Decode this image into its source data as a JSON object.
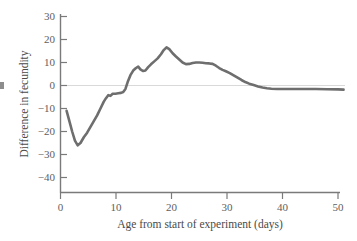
{
  "chart_data": {
    "type": "line",
    "title": "",
    "xlabel": "Age from start of experiment (days)",
    "ylabel": "Difference in fecundity",
    "xlim": [
      0,
      51
    ],
    "ylim": [
      -47,
      33
    ],
    "xticks": [
      0,
      10,
      20,
      30,
      40,
      50
    ],
    "xtick_labels": [
      "0",
      "10",
      "20",
      "30",
      "40",
      "50"
    ],
    "yticks": [
      30,
      20,
      10,
      0,
      -10,
      -20,
      -30,
      -40
    ],
    "ytick_labels": [
      "30",
      "20",
      "10",
      "0",
      "−10",
      "−20",
      "−30",
      "−40"
    ],
    "grid": false,
    "legend": null,
    "zero_reference_line": 0,
    "series": [
      {
        "name": "Difference in fecundity",
        "color": "#6e6e6e",
        "x": [
          1.1,
          1.6,
          2.1,
          2.6,
          3.1,
          3.6,
          4.2,
          4.8,
          5.4,
          6.0,
          6.6,
          7.2,
          7.8,
          8.2,
          8.6,
          9.0,
          9.4,
          9.9,
          10.4,
          10.9,
          11.3,
          11.7,
          12.1,
          12.6,
          13.1,
          13.6,
          14.0,
          14.4,
          14.9,
          15.3,
          15.8,
          16.3,
          16.9,
          17.5,
          18.1,
          18.6,
          19.1,
          19.6,
          20.2,
          20.8,
          21.4,
          22.0,
          22.6,
          23.2,
          23.8,
          24.4,
          25.0,
          25.6,
          26.2,
          26.8,
          27.4,
          28.0,
          28.6,
          29.2,
          29.8,
          30.5,
          31.2,
          31.9,
          32.6,
          33.3,
          34.0,
          34.8,
          35.6,
          36.4,
          37.2,
          38.0,
          39.0,
          40.5,
          42.0,
          44.0,
          46.0,
          48.0,
          50.0,
          51.0
        ],
        "y": [
          -11.0,
          -15.5,
          -20.0,
          -24.0,
          -26.0,
          -25.0,
          -22.5,
          -20.5,
          -18.0,
          -15.5,
          -13.0,
          -10.0,
          -7.0,
          -5.5,
          -4.2,
          -4.5,
          -3.6,
          -3.6,
          -3.4,
          -3.2,
          -2.8,
          -1.5,
          1.5,
          4.5,
          6.5,
          7.6,
          8.2,
          7.0,
          6.3,
          6.5,
          8.0,
          9.2,
          10.5,
          11.8,
          13.6,
          15.4,
          16.6,
          15.8,
          14.0,
          12.6,
          11.3,
          10.0,
          9.3,
          9.4,
          9.8,
          10.0,
          10.0,
          9.9,
          9.7,
          9.6,
          9.4,
          8.6,
          7.6,
          6.8,
          6.2,
          5.4,
          4.4,
          3.4,
          2.4,
          1.5,
          0.8,
          0.2,
          -0.4,
          -0.9,
          -1.2,
          -1.4,
          -1.5,
          -1.5,
          -1.5,
          -1.5,
          -1.5,
          -1.6,
          -1.7,
          -1.8
        ]
      }
    ]
  },
  "axes": {
    "y_title": "Difference in fecundity",
    "x_title": "Age from start of experiment (days)"
  }
}
